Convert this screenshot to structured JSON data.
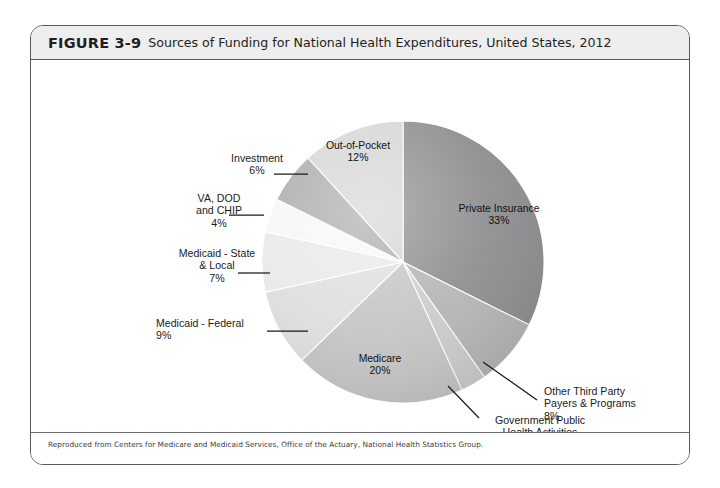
{
  "figure": {
    "number": "FIGURE 3-9",
    "title": "Sources of Funding for National Health Expenditures, United States, 2012",
    "source_note": "Reproduced from Centers for Medicare and Medicaid Services, Office of the Actuary, National Health Statistics Group."
  },
  "chart_data": {
    "type": "pie",
    "title": "Sources of Funding for National Health Expenditures, United States, 2012",
    "xlabel": "",
    "ylabel": "",
    "units": "percent",
    "start_angle_deg": 0,
    "direction": "clockwise",
    "legend": "none",
    "grid": false,
    "labels_show_percent": true,
    "categories": [
      "Private Insurance",
      "Other Third Party Payers & Programs",
      "Government Public Health Activities",
      "Medicare",
      "Medicaid - Federal",
      "Medicaid - State & Local",
      "VA, DOD and CHIP",
      "Investment",
      "Out-of-Pocket"
    ],
    "values": [
      33,
      8,
      3,
      20,
      9,
      7,
      4,
      6,
      12
    ],
    "slices": [
      {
        "name": "Private Insurance",
        "value": 33,
        "percent_label": "33%",
        "color": "#8e8e90",
        "label_placement": "inside",
        "label_lines": [
          "Private Insurance",
          "33%"
        ],
        "label_x": 468,
        "label_y": 186,
        "label_anchor": "middle",
        "leader": null
      },
      {
        "name": "Other Third Party Payers & Programs",
        "value": 8,
        "percent_label": "8%",
        "color": "#b5b5b7",
        "label_placement": "outside",
        "label_lines": [
          "Other Third Party",
          "Payers & Programs",
          "8%"
        ],
        "label_x": 513,
        "label_y": 369,
        "label_anchor": "start",
        "leader": {
          "x1": 452,
          "y1": 336,
          "x2": 506,
          "y2": 374
        }
      },
      {
        "name": "Government Public Health Activities",
        "value": 3,
        "percent_label": "3%",
        "color": "#cccccd",
        "label_placement": "outside",
        "label_lines": [
          "Government Public",
          "Health Activities",
          "3%"
        ],
        "label_x": 509,
        "label_y": 398,
        "label_anchor": "middle",
        "leader": {
          "x1": 417,
          "y1": 360,
          "x2": 448,
          "y2": 392
        }
      },
      {
        "name": "Medicare",
        "value": 20,
        "percent_label": "20%",
        "color": "#c5c5c6",
        "label_placement": "inside",
        "label_lines": [
          "Medicare",
          "20%"
        ],
        "label_x": 349,
        "label_y": 336,
        "label_anchor": "middle",
        "leader": null
      },
      {
        "name": "Medicaid - Federal",
        "value": 9,
        "percent_label": "9%",
        "color": "#dededf",
        "label_placement": "outside",
        "label_lines": [
          "Medicaid - Federal",
          "9%"
        ],
        "label_x": 125,
        "label_y": 301,
        "label_anchor": "start",
        "leader": {
          "x1": 236,
          "y1": 305,
          "x2": 277,
          "y2": 305
        }
      },
      {
        "name": "Medicaid - State & Local",
        "value": 7,
        "percent_label": "7%",
        "color": "#e9e9ea",
        "label_placement": "outside",
        "label_lines": [
          "Medicaid - State",
          "& Local",
          "7%"
        ],
        "label_x": 186,
        "label_y": 231,
        "label_anchor": "middle",
        "leader": {
          "x1": 207,
          "y1": 247,
          "x2": 239,
          "y2": 247
        }
      },
      {
        "name": "VA, DOD and CHIP",
        "value": 4,
        "percent_label": "4%",
        "color": "#f7f7f7",
        "label_placement": "outside",
        "label_lines": [
          "VA, DOD",
          "and CHIP",
          "4%"
        ],
        "label_x": 188,
        "label_y": 176,
        "label_anchor": "middle",
        "leader": {
          "x1": 198,
          "y1": 189,
          "x2": 233,
          "y2": 189
        }
      },
      {
        "name": "Investment",
        "value": 6,
        "percent_label": "6%",
        "color": "#adadaf",
        "label_placement": "outside",
        "label_lines": [
          "Investment",
          "6%"
        ],
        "label_x": 226,
        "label_y": 136,
        "label_anchor": "middle",
        "leader": {
          "x1": 243,
          "y1": 148,
          "x2": 277,
          "y2": 148
        }
      },
      {
        "name": "Out-of-Pocket",
        "value": 12,
        "percent_label": "12%",
        "color": "#d6d6d7",
        "label_placement": "inside",
        "label_lines": [
          "Out-of-Pocket",
          "12%"
        ],
        "label_x": 327,
        "label_y": 123,
        "label_anchor": "middle",
        "leader": null
      }
    ],
    "geometry": {
      "center_x": 372,
      "center_y": 236,
      "radius": 141
    }
  }
}
